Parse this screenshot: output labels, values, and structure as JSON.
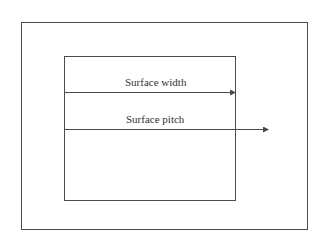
{
  "diagram": {
    "labels": {
      "width": "Surface width",
      "pitch": "Surface pitch"
    },
    "colors": {
      "stroke": "#4a4a4a",
      "background": "#ffffff"
    }
  }
}
